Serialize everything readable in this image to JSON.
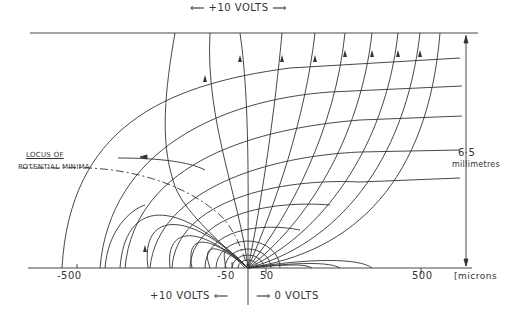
{
  "diagram": {
    "top_electrode_label": "+10 VOLTS",
    "bottom_left_label": "+10 VOLTS",
    "bottom_right_label": "0 VOLTS",
    "locus_label_line1": "LOCUS OF",
    "locus_label_line2": "POTENTIAL MINIMA",
    "dimension_value": "6·5",
    "dimension_unit": "millimetres",
    "axis": {
      "unit": "[microns",
      "ticks": [
        {
          "label": "-500",
          "value": -500
        },
        {
          "label": "-50",
          "value": -50
        },
        {
          "label": "50",
          "value": 50
        },
        {
          "label": "500",
          "value": 500
        }
      ]
    },
    "colors": {
      "line": "#333333",
      "background": "#ffffff"
    }
  }
}
